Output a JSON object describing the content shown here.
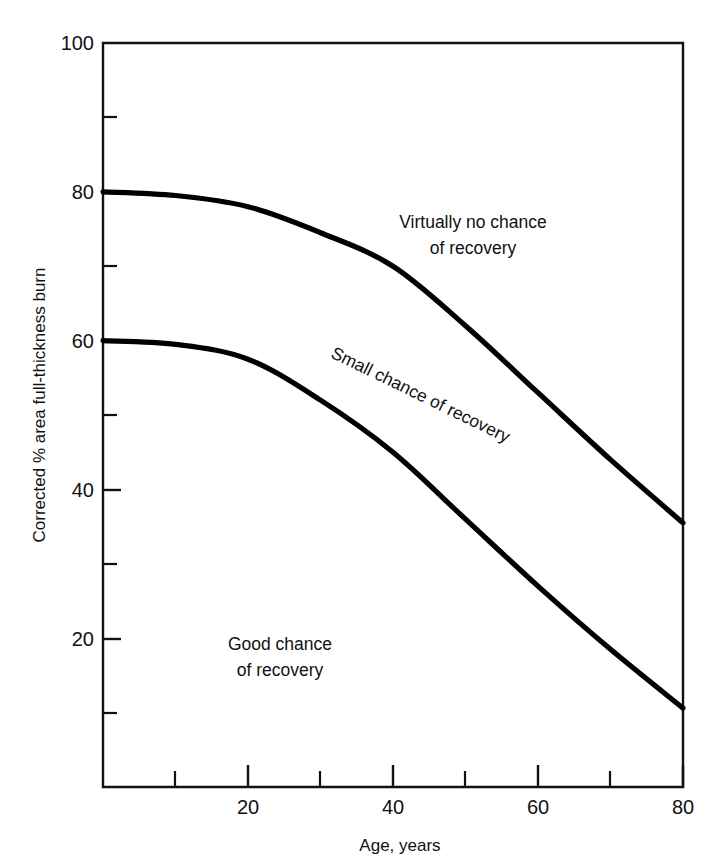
{
  "chart_data": {
    "type": "line",
    "title": "",
    "xlabel": "Age, years",
    "ylabel": "Corrected % area full-thickness burn",
    "xlim": [
      0,
      80
    ],
    "ylim": [
      0,
      100
    ],
    "grid": false,
    "legend_position": "none",
    "x_major_ticks": [
      20,
      40,
      60,
      80
    ],
    "x_minor_ticks": [
      10,
      30,
      50,
      70
    ],
    "x_tick_labels": [
      "20",
      "40",
      "60",
      "80"
    ],
    "y_major_ticks": [
      20,
      40,
      60,
      80,
      100
    ],
    "y_minor_ticks": [
      10,
      30,
      50,
      70,
      90
    ],
    "y_tick_labels": [
      "20",
      "40",
      "60",
      "80",
      "100"
    ],
    "x": [
      0,
      10,
      20,
      30,
      40,
      50,
      60,
      70,
      80
    ],
    "series": [
      {
        "name": "upper-boundary",
        "values": [
          80,
          79.5,
          78,
          74.5,
          70,
          62,
          53,
          44,
          35.5
        ]
      },
      {
        "name": "lower-boundary",
        "values": [
          60,
          59.5,
          57.5,
          52,
          45,
          36,
          27,
          18.5,
          10.6
        ]
      }
    ],
    "annotations": [
      {
        "id": "zone-top",
        "lines": [
          "Virtually no chance",
          "of recovery"
        ],
        "x_data": 47,
        "y_data": 79,
        "rotation": 0
      },
      {
        "id": "zone-middle",
        "lines": [
          "Small chance of recovery"
        ],
        "x_data": 38,
        "y_data": 56,
        "rotation": 26
      },
      {
        "id": "zone-bottom",
        "lines": [
          "Good chance",
          "of recovery"
        ],
        "x_data": 19,
        "y_data": 17,
        "rotation": 0
      }
    ],
    "colors": {
      "curve": "#000000",
      "axis": "#111111",
      "background": "#ffffff"
    }
  },
  "axes": {
    "y_label": "Corrected % area full-thickness burn",
    "x_label": "Age, years",
    "y_tick_100": "100",
    "y_tick_80": "80",
    "y_tick_60": "60",
    "y_tick_40": "40",
    "y_tick_20": "20",
    "x_tick_20": "20",
    "x_tick_40": "40",
    "x_tick_60": "60",
    "x_tick_80": "80"
  },
  "annotations": {
    "top_line1": "Virtually no chance",
    "top_line2": "of recovery",
    "middle": "Small chance of recovery",
    "bottom_line1": "Good chance",
    "bottom_line2": "of recovery"
  }
}
